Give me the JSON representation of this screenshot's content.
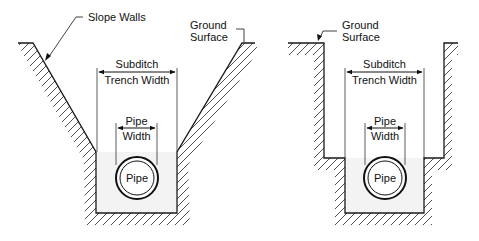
{
  "diagram": {
    "left_trench": {
      "title_label": "Slope Walls",
      "ground_label_1": "Ground",
      "ground_label_2": "Surface",
      "trench_label_1": "Subditch",
      "trench_label_2": "Trench Width",
      "pipe_width_1": "Pipe",
      "pipe_width_2": "Width",
      "pipe_label": "Pipe"
    },
    "right_trench": {
      "ground_label_1": "Ground",
      "ground_label_2": "Surface",
      "trench_label_1": "Subditch",
      "trench_label_2": "Trench Width",
      "pipe_width_1": "Pipe",
      "pipe_width_2": "Width",
      "pipe_label": "Pipe"
    },
    "colors": {
      "line": "#1a1a1a",
      "fill": "#f2f2f2",
      "hatch": "#333333"
    }
  }
}
